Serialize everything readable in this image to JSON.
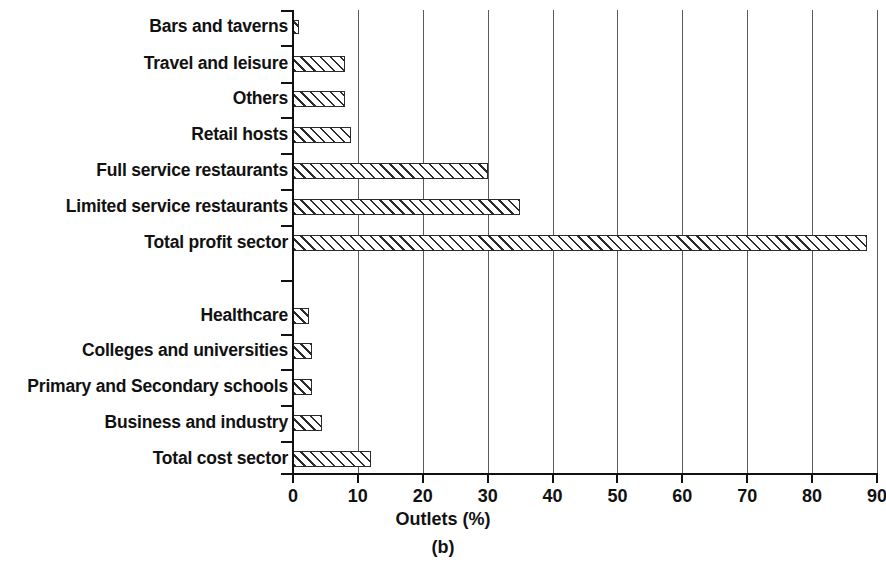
{
  "chart_data": {
    "type": "bar",
    "orientation": "horizontal",
    "title": "",
    "subtitle": "",
    "xlabel": "Outlets (%)",
    "ylabel": "",
    "caption": "(b)",
    "xlim": [
      0,
      90
    ],
    "xticks": [
      0,
      10,
      20,
      30,
      40,
      50,
      60,
      70,
      80,
      90
    ],
    "xtick_labels": [
      "0",
      "10",
      "20",
      "30",
      "40",
      "50",
      "60",
      "70",
      "80",
      "90"
    ],
    "grid": "vertical-only",
    "legend": null,
    "bar_style": {
      "fill": "diagonal-hatch",
      "hatch_color": "#2b2b2b",
      "background": "#ffffff",
      "edge_color": "#2b2b2b"
    },
    "categories": [
      "Bars and taverns",
      "Travel and leisure",
      "Others",
      "Retail hosts",
      "Full service restaurants",
      "Limited service restaurants",
      "Total profit sector",
      "Healthcare",
      "Colleges and universities",
      "Primary and Secondary schools",
      "Business and industry",
      "Total cost sector"
    ],
    "values": [
      1,
      8,
      8,
      9,
      30,
      35,
      88.5,
      2.5,
      3,
      3,
      4.5,
      12
    ],
    "groups": [
      {
        "name": "profit sector",
        "categories": [
          "Bars and taverns",
          "Travel and leisure",
          "Others",
          "Retail hosts",
          "Full service restaurants",
          "Limited service restaurants",
          "Total profit sector"
        ],
        "values": [
          1,
          8,
          8,
          9,
          30,
          35,
          88.5
        ]
      },
      {
        "name": "cost sector",
        "categories": [
          "Healthcare",
          "Colleges and universities",
          "Primary and Secondary schools",
          "Business and industry",
          "Total cost sector"
        ],
        "values": [
          2.5,
          3,
          3,
          4.5,
          12
        ]
      }
    ],
    "bars": [
      {
        "label": "Bars and taverns",
        "value": 1,
        "top": 20,
        "height": 14
      },
      {
        "label": "Travel and leisure",
        "value": 8,
        "top": 56,
        "height": 16
      },
      {
        "label": "Others",
        "value": 8,
        "top": 91,
        "height": 16
      },
      {
        "label": "Retail hosts",
        "value": 9,
        "top": 127,
        "height": 16
      },
      {
        "label": "Full service restaurants",
        "value": 30,
        "top": 163,
        "height": 16
      },
      {
        "label": "Limited service restaurants",
        "value": 35,
        "top": 199,
        "height": 16
      },
      {
        "label": "Total profit sector",
        "value": 88.5,
        "top": 235,
        "height": 16
      },
      {
        "label": "Healthcare",
        "value": 2.5,
        "top": 308,
        "height": 16
      },
      {
        "label": "Colleges and universities",
        "value": 3,
        "top": 343,
        "height": 16
      },
      {
        "label": "Primary and Secondary schools",
        "value": 3,
        "top": 379,
        "height": 16
      },
      {
        "label": "Business and industry",
        "value": 4.5,
        "top": 415,
        "height": 16
      },
      {
        "label": "Total cost sector",
        "value": 12,
        "top": 451,
        "height": 16
      }
    ]
  }
}
